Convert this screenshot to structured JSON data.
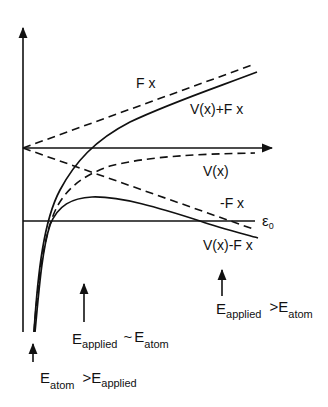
{
  "diagram": {
    "type": "potential-energy-diagram",
    "curves": [
      {
        "id": "fx",
        "label": "F x",
        "style": "dashed"
      },
      {
        "id": "v_plus_fx",
        "label": "V(x)+F x",
        "style": "solid"
      },
      {
        "id": "vx",
        "label": "V(x)",
        "style": "dashed"
      },
      {
        "id": "minus_fx",
        "label": "-F x",
        "style": "dashed"
      },
      {
        "id": "v_minus_fx",
        "label": "V(x)-F x",
        "style": "solid"
      }
    ],
    "level": {
      "label": "ε",
      "sub": "0"
    },
    "annotations": [
      {
        "id": "weak",
        "main": "E",
        "sub1": "atom",
        "op": ">",
        "main2": "E",
        "sub2": "applied"
      },
      {
        "id": "comparable",
        "main": "E",
        "sub1": "applied",
        "op": "~",
        "main2": "E",
        "sub2": "atom"
      },
      {
        "id": "strong",
        "main": "E",
        "sub1": "applied",
        "op": ">",
        "main2": "E",
        "sub2": "atom"
      }
    ]
  }
}
